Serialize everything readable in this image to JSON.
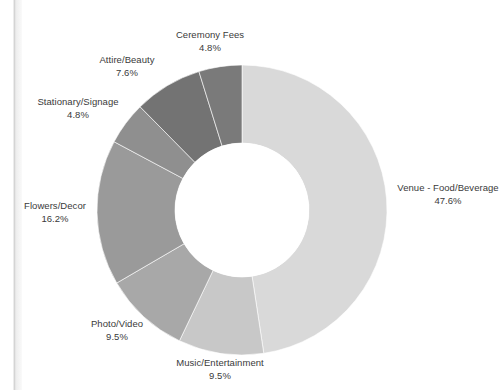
{
  "chart_data": {
    "type": "pie",
    "variant": "donut",
    "title": "",
    "subtitle": "",
    "xlabel": "",
    "ylabel": "",
    "legend_position": "none",
    "labels_position": "outside",
    "grid": false,
    "hole_ratio": 0.46,
    "start_angle_deg": 0,
    "direction": "clockwise",
    "categories": [
      "Venue - Food/Beverage",
      "Music/Entertainment",
      "Photo/Video",
      "Flowers/Decor",
      "Stationary/Signage",
      "Attire/Beauty",
      "Ceremony Fees"
    ],
    "values": [
      47.6,
      9.5,
      9.5,
      16.2,
      4.8,
      7.6,
      4.8
    ],
    "value_labels": [
      "47.6%",
      "9.5%",
      "9.5%",
      "16.2%",
      "4.8%",
      "7.6%",
      "4.8%"
    ],
    "colors": [
      "#d9d9d9",
      "#c8c8c8",
      "#a8a8a8",
      "#9a9a9a",
      "#8f8f8f",
      "#737373",
      "#7a7a7a"
    ],
    "total": 100.0,
    "units": "percent"
  },
  "slices": [
    {
      "name": "Venue - Food/Beverage",
      "percent_text": "47.6%",
      "value": 47.6,
      "color": "#d9d9d9"
    },
    {
      "name": "Music/Entertainment",
      "percent_text": "9.5%",
      "value": 9.5,
      "color": "#c8c8c8"
    },
    {
      "name": "Photo/Video",
      "percent_text": "9.5%",
      "value": 9.5,
      "color": "#a8a8a8"
    },
    {
      "name": "Flowers/Decor",
      "percent_text": "16.2%",
      "value": 16.2,
      "color": "#9a9a9a"
    },
    {
      "name": "Stationary/Signage",
      "percent_text": "4.8%",
      "value": 4.8,
      "color": "#8f8f8f"
    },
    {
      "name": "Attire/Beauty",
      "percent_text": "7.6%",
      "value": 7.6,
      "color": "#737373"
    },
    {
      "name": "Ceremony Fees",
      "percent_text": "4.8%",
      "value": 4.8,
      "color": "#7a7a7a"
    }
  ],
  "geometry": {
    "center_x": 242,
    "center_y": 210,
    "outer_radius": 145,
    "inner_radius": 67
  },
  "label_positions": [
    {
      "x": 448,
      "y": 182,
      "align": "center"
    },
    {
      "x": 220,
      "y": 357,
      "align": "center"
    },
    {
      "x": 117,
      "y": 318,
      "align": "center"
    },
    {
      "x": 55,
      "y": 200,
      "align": "center"
    },
    {
      "x": 78,
      "y": 96,
      "align": "center"
    },
    {
      "x": 127,
      "y": 54,
      "align": "center"
    },
    {
      "x": 210,
      "y": 29,
      "align": "center"
    }
  ],
  "colors": {
    "background": "#ffffff",
    "text": "#3a3a3a",
    "hole": "#ffffff",
    "page_edge": "#cfcfcf"
  }
}
